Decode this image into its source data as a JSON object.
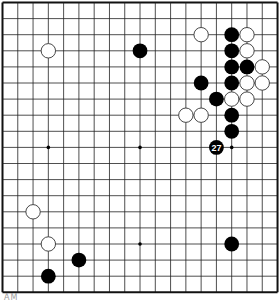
{
  "board": {
    "size": 19,
    "origin": {
      "x": 2.5,
      "y": 2.5
    },
    "spacing": {
      "x": 15.28,
      "y": 16.1
    },
    "line_color": "#222222",
    "border_color": "#111111",
    "background": "#ffffff",
    "stone_black": "#000000",
    "stone_white_fill": "#ffffff",
    "stone_white_stroke": "#333333",
    "hoshi": [
      [
        3,
        3
      ],
      [
        9,
        3
      ],
      [
        15,
        3
      ],
      [
        3,
        9
      ],
      [
        9,
        9
      ],
      [
        15,
        9
      ],
      [
        3,
        15
      ],
      [
        9,
        15
      ],
      [
        15,
        15
      ]
    ],
    "stones": [
      {
        "color": "white",
        "col": 3,
        "row": 3
      },
      {
        "color": "black",
        "col": 9,
        "row": 3
      },
      {
        "color": "white",
        "col": 13,
        "row": 2
      },
      {
        "color": "black",
        "col": 15,
        "row": 2
      },
      {
        "color": "white",
        "col": 16,
        "row": 2
      },
      {
        "color": "black",
        "col": 15,
        "row": 3
      },
      {
        "color": "white",
        "col": 16,
        "row": 3
      },
      {
        "color": "black",
        "col": 15,
        "row": 4
      },
      {
        "color": "black",
        "col": 16,
        "row": 4
      },
      {
        "color": "white",
        "col": 17,
        "row": 4
      },
      {
        "color": "black",
        "col": 13,
        "row": 5
      },
      {
        "color": "black",
        "col": 15,
        "row": 5
      },
      {
        "color": "white",
        "col": 16,
        "row": 5
      },
      {
        "color": "white",
        "col": 17,
        "row": 5
      },
      {
        "color": "black",
        "col": 14,
        "row": 6
      },
      {
        "color": "white",
        "col": 15,
        "row": 6
      },
      {
        "color": "white",
        "col": 16,
        "row": 6
      },
      {
        "color": "white",
        "col": 12,
        "row": 7
      },
      {
        "color": "white",
        "col": 13,
        "row": 7
      },
      {
        "color": "black",
        "col": 15,
        "row": 7
      },
      {
        "color": "black",
        "col": 15,
        "row": 8
      },
      {
        "color": "black",
        "col": 14,
        "row": 9,
        "label": "27"
      },
      {
        "color": "white",
        "col": 2,
        "row": 13
      },
      {
        "color": "white",
        "col": 3,
        "row": 15
      },
      {
        "color": "black",
        "col": 15,
        "row": 15
      },
      {
        "color": "black",
        "col": 5,
        "row": 16
      },
      {
        "color": "black",
        "col": 3,
        "row": 17
      }
    ]
  },
  "caption": {
    "text": "AM"
  }
}
